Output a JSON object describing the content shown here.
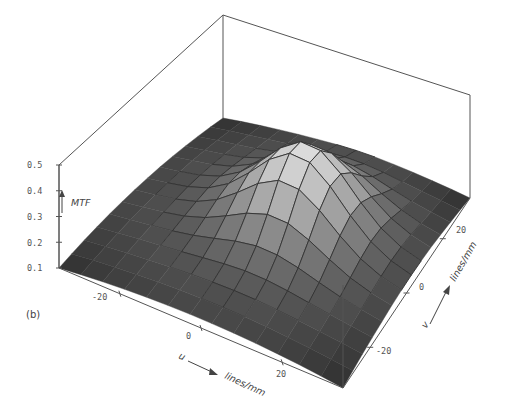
{
  "figure": {
    "panel_label": "(b)"
  },
  "chart_data": {
    "type": "surface3d",
    "title": "",
    "zlabel": "MTF",
    "xlabel": "u",
    "xunit": "lines/mm",
    "ylabel": "v",
    "yunit": "lines/mm",
    "z_ticks": [
      "0.1",
      "0.2",
      "0.3",
      "0.4",
      "0.5"
    ],
    "zlim": [
      0.1,
      0.5
    ],
    "x_ticks": [
      "-20",
      "0",
      "20"
    ],
    "y_ticks": [
      "-20",
      "0",
      "20"
    ],
    "xlim": [
      -35,
      35
    ],
    "ylim": [
      -35,
      35
    ],
    "grid_resolution": 13,
    "peak": {
      "u": 5,
      "v": 5,
      "mtf": 0.45
    },
    "base_dome_max": 0.17,
    "colors": {
      "surface_dark": "#2e2e2e",
      "surface_light": "#e4e4e4",
      "mesh_line": "#333333",
      "box": "#555555"
    }
  }
}
